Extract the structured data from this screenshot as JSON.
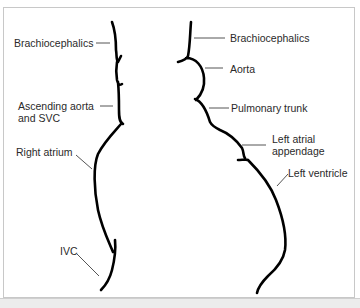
{
  "figure": {
    "type": "heart silhouette outline diagram (chest radiograph cardiac borders)",
    "left_border": {
      "labels": [
        {
          "id": "brachiocephalics-left",
          "text": "Brachiocephalics"
        },
        {
          "id": "ascending-aorta",
          "line1": "Ascending aorta",
          "line2": "and SVC"
        },
        {
          "id": "right-atrium",
          "text": "Right atrium"
        },
        {
          "id": "ivc",
          "text": "IVC"
        }
      ]
    },
    "right_border": {
      "labels": [
        {
          "id": "brachiocephalics-right",
          "text": "Brachiocephalics"
        },
        {
          "id": "aorta",
          "text": "Aorta"
        },
        {
          "id": "pulmonary-trunk",
          "text": "Pulmonary trunk"
        },
        {
          "id": "left-atrial-appendage",
          "line1": "Left atrial",
          "line2": "appendage"
        },
        {
          "id": "left-ventricle",
          "text": "Left ventricle"
        }
      ]
    },
    "colors": {
      "outline": "#000000",
      "leader_line": "#555555",
      "text": "#2a2a2a",
      "frame_border": "#c8c8c8",
      "bottom_bar": "#ececec"
    }
  }
}
